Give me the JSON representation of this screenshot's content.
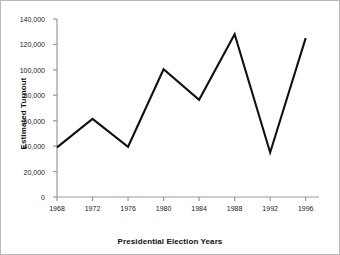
{
  "chart_data": {
    "type": "line",
    "title": "",
    "xlabel": "Presidential Election Years",
    "ylabel": "Estimated Turnout",
    "x": [
      1968,
      1972,
      1976,
      1980,
      1984,
      1988,
      1992,
      1996
    ],
    "categories": [
      "1968",
      "1972",
      "1976",
      "1980",
      "1984",
      "1988",
      "1992",
      "1996"
    ],
    "values": [
      39000,
      61500,
      39500,
      100500,
      76500,
      128000,
      35000,
      125000
    ],
    "series": [
      {
        "name": "Estimated Turnout",
        "values": [
          39000,
          61500,
          39500,
          100500,
          76500,
          128000,
          35000,
          125000
        ],
        "color": "#111111"
      }
    ],
    "xlim": [
      1968,
      1997.5
    ],
    "ylim": [
      0,
      140000
    ],
    "ytick_values": [
      0,
      20000,
      40000,
      60000,
      80000,
      100000,
      120000,
      140000
    ],
    "ytick_labels": [
      "0",
      "20,000",
      "40,000",
      "60,000",
      "80,000",
      "100,000",
      "120,000",
      "140,000"
    ],
    "xtick_values": [
      1968,
      1972,
      1976,
      1980,
      1984,
      1988,
      1992,
      1996
    ],
    "xtick_labels": [
      "1968",
      "1972",
      "1976",
      "1980",
      "1984",
      "1988",
      "1992",
      "1996"
    ],
    "grid": false,
    "legend": false,
    "legend_position": "none",
    "axis_color": "#999999",
    "line_color": "#111111",
    "background_color": "#ffffff"
  },
  "axis_titles": {
    "y": "Estimated Turnout",
    "x": "Presidential Election Years"
  }
}
